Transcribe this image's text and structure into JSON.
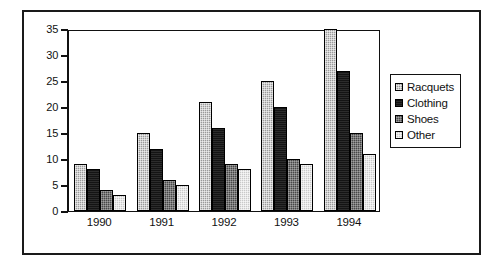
{
  "chart_data": {
    "type": "bar",
    "title": "",
    "subtitle": "",
    "xlabel": "",
    "ylabel": "",
    "categories": [
      "1990",
      "1991",
      "1992",
      "1993",
      "1994"
    ],
    "series": [
      {
        "name": "Racquets",
        "values": [
          9,
          15,
          21,
          25,
          35
        ],
        "color": "#9a9a9a"
      },
      {
        "name": "Clothing",
        "values": [
          8,
          12,
          16,
          20,
          27
        ],
        "color": "#141414"
      },
      {
        "name": "Shoes",
        "values": [
          4,
          6,
          9,
          10,
          15
        ],
        "color": "#474747"
      },
      {
        "name": "Other",
        "values": [
          3,
          5,
          8,
          9,
          11
        ],
        "color": "#c9c9c9"
      }
    ],
    "ylim": [
      0,
      35
    ],
    "yticks": [
      0,
      5,
      10,
      15,
      20,
      25,
      30,
      35
    ],
    "ytick_labels": [
      "0",
      "5",
      "10",
      "15",
      "20",
      "25",
      "30",
      "35"
    ],
    "grid": false,
    "legend_position": "right",
    "legend_entries": [
      "Racquets",
      "Clothing",
      "Shoes",
      "Other"
    ]
  }
}
